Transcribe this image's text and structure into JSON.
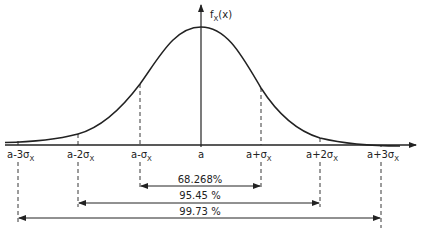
{
  "diagram": {
    "y_axis_label": {
      "main": "f",
      "sub": "X",
      "arg": "(x)"
    },
    "x_ticks": [
      {
        "id": "a-3s",
        "text": "a-3σ",
        "sub": "X",
        "x": 18
      },
      {
        "id": "a-2s",
        "text": "a-2σ",
        "sub": "X",
        "x": 78
      },
      {
        "id": "a-s",
        "text": "a-σ",
        "sub": "X",
        "x": 140
      },
      {
        "id": "a",
        "text": "a",
        "sub": "",
        "x": 201
      },
      {
        "id": "a+s",
        "text": "a+σ",
        "sub": "X",
        "x": 261
      },
      {
        "id": "a+2s",
        "text": "a+2σ",
        "sub": "X",
        "x": 320
      },
      {
        "id": "a+3s",
        "text": "a+3σ",
        "sub": "X",
        "x": 381
      }
    ],
    "intervals": [
      {
        "label": "68.268%",
        "from": "a-σ",
        "to": "a+σ"
      },
      {
        "label": "95.45 %",
        "from": "a-2σ",
        "to": "a+2σ"
      },
      {
        "label": "99.73 %",
        "from": "a-3σ",
        "to": "a+3σ"
      }
    ],
    "colors": {
      "line": "#222222",
      "background": "#ffffff"
    }
  }
}
